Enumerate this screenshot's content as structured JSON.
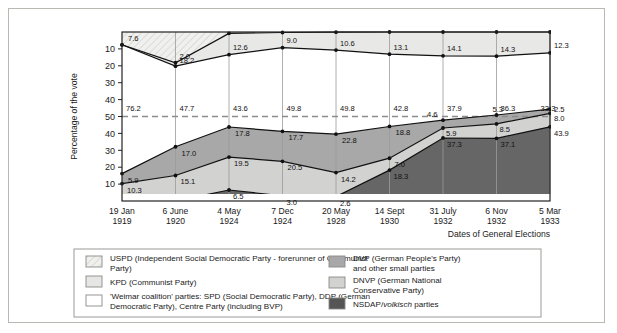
{
  "chart_data": {
    "type": "area",
    "title": "",
    "ylabel": "Percentage of the vote",
    "xlabel": "Dates of General Elections",
    "grid": true,
    "legend_position": "bottom",
    "ylim": [
      0,
      100
    ],
    "yticks_top": [
      "10",
      "20",
      "30",
      "40",
      "50"
    ],
    "yticks_bottom": [
      "40",
      "30",
      "20",
      "10"
    ],
    "yticks_all": [
      "10",
      "20",
      "30",
      "40",
      "50",
      "40",
      "30",
      "20",
      "10"
    ],
    "majority_line": "50",
    "categories": [
      {
        "day": "19 Jan",
        "year": "1919"
      },
      {
        "day": "6 June",
        "year": "1920"
      },
      {
        "day": "4 May",
        "year": "1924"
      },
      {
        "day": "7 Dec",
        "year": "1924"
      },
      {
        "day": "20 May",
        "year": "1928"
      },
      {
        "day": "14 Sept",
        "year": "1930"
      },
      {
        "day": "31 July",
        "year": "1932"
      },
      {
        "day": "6 Nov",
        "year": "1932"
      },
      {
        "day": "5 Mar",
        "year": "1933"
      }
    ],
    "series": [
      {
        "name": "USPD (Independent Social Democratic Party - forerunner of Communist Party)",
        "key": "uspd",
        "color": "#e8e8e6",
        "pattern": "hatch",
        "values": [
          7.6,
          18.2,
          0.8,
          0.3,
          0.1,
          0.0,
          0.0,
          0.0,
          0.0
        ],
        "labels": [
          "7.6",
          "18.2",
          "",
          "",
          "",
          "",
          "",
          "",
          ""
        ]
      },
      {
        "name": "KPD (Communist Party)",
        "key": "kpd",
        "color": "#e8e8e6",
        "pattern": "solid",
        "values": [
          0.0,
          2.0,
          12.6,
          9.0,
          10.6,
          13.1,
          14.1,
          14.3,
          12.3
        ],
        "labels": [
          "",
          "2.0",
          "12.6",
          "9.0",
          "10.6",
          "13.1",
          "14.1",
          "14.3",
          "12.3"
        ]
      },
      {
        "name": "'Weimar coalition' parties: SPD (Social Democratic Party), DDP (German Democratic Party), Centre Party (including BVP)",
        "key": "weimar",
        "color": "#ffffff",
        "pattern": "solid",
        "values": [
          76.2,
          47.7,
          43.6,
          49.8,
          49.8,
          42.8,
          37.9,
          36.3,
          33.3
        ],
        "labels": [
          "76.2",
          "47.7",
          "43.6",
          "49.8",
          "49.8",
          "42.8",
          "37.9",
          "36.3",
          "33.3"
        ]
      },
      {
        "name": "DVP (German People's Party) and other small parties",
        "key": "dvp",
        "color": "#a8a8a8",
        "pattern": "solid",
        "values": [
          5.9,
          17.0,
          17.8,
          17.7,
          22.8,
          18.8,
          4.6,
          5.3,
          2.5
        ],
        "labels": [
          "5.9",
          "17.0",
          "17.8",
          "17.7",
          "22.8",
          "18.8",
          "4.6",
          "5.3",
          "2.5"
        ]
      },
      {
        "name": "DNVP (German National Conservative Party)",
        "key": "dnvp",
        "color": "#d2d2d0",
        "pattern": "solid",
        "values": [
          10.3,
          15.1,
          19.5,
          20.5,
          14.2,
          7.0,
          5.9,
          8.5,
          8.0
        ],
        "labels": [
          "10.3",
          "15.1",
          "19.5",
          "20.5",
          "14.2",
          "7.0",
          "5.9",
          "8.5",
          "8.0"
        ]
      },
      {
        "name": "NSDAP/volkisch parties",
        "key": "nsdap",
        "color": "#666666",
        "pattern": "solid",
        "values": [
          0.0,
          0.0,
          6.5,
          3.0,
          2.6,
          18.3,
          37.3,
          37.1,
          43.9
        ],
        "labels": [
          "",
          "",
          "6.5",
          "3.0",
          "2.6",
          "18.3",
          "37.3",
          "37.1",
          "43.9"
        ]
      }
    ]
  },
  "axis": {
    "y_title": "Percentage of the vote",
    "x_title": "Dates of General Elections"
  },
  "legend": {
    "left_column": [
      {
        "swatch": "hatch",
        "color": "#efefed",
        "label": "USPD (Independent Social Democratic Party - forerunner of Communist Party)"
      },
      {
        "swatch": "solid",
        "color": "#e6e6e4",
        "label": "KPD (Communist Party)"
      },
      {
        "swatch": "solid",
        "color": "#ffffff",
        "label_pre": "'Weimar coalition' parties: SPD (Social Democratic Party), DDP (German Democratic Party), Centre Party (including BVP)"
      }
    ],
    "right_column": [
      {
        "swatch": "solid",
        "color": "#a8a8a8",
        "label_l1": "DVP (German People's Party)",
        "label_l2": "and other small parties"
      },
      {
        "swatch": "solid",
        "color": "#d2d2d0",
        "label_l1": "DNVP (German National",
        "label_l2": "Conservative Party)"
      },
      {
        "swatch": "solid",
        "color": "#555555",
        "label_l1": "NSDAP/",
        "label_l1_italic": "volkisch",
        "label_l1_end": " parties"
      }
    ]
  },
  "colors": {
    "frame_border": "#b9b9b3",
    "plot_border": "#222222",
    "gridline": "#9a9a9a",
    "majority_dash": "#8c8c8c",
    "uspd": "#e8e8e6",
    "kpd": "#e8e8e6",
    "weimar": "#ffffff",
    "dvp": "#a8a8a8",
    "dnvp": "#d2d2d0",
    "nsdap": "#666666"
  }
}
